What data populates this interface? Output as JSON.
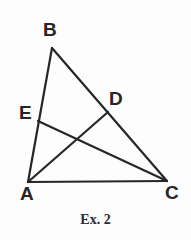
{
  "figure": {
    "caption": "Ex. 2",
    "background_color": "#fdfdfd",
    "ink_color": "#262626",
    "labels": {
      "A": "A",
      "B": "B",
      "C": "C",
      "D": "D",
      "E": "E"
    },
    "points": {
      "A": {
        "x": 28,
        "y": 182
      },
      "B": {
        "x": 52,
        "y": 48
      },
      "C": {
        "x": 167,
        "y": 181
      },
      "D": {
        "x": 108,
        "y": 112
      },
      "E": {
        "x": 38,
        "y": 121
      }
    },
    "segments": [
      {
        "name": "AB",
        "from": "A",
        "to": "B"
      },
      {
        "name": "BC",
        "from": "B",
        "to": "C"
      },
      {
        "name": "AC",
        "from": "A",
        "to": "C"
      },
      {
        "name": "AD",
        "from": "A",
        "to": "D"
      },
      {
        "name": "EC",
        "from": "E",
        "to": "C"
      }
    ],
    "stroke_width": 2.2
  }
}
